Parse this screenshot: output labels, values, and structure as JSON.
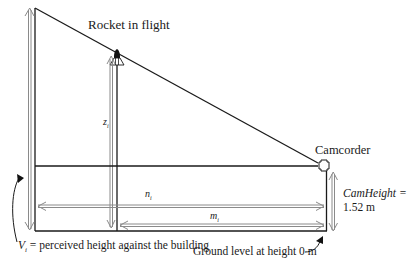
{
  "diagram": {
    "labels": {
      "rocket": "Rocket in flight",
      "camcorder": "Camcorder",
      "z_var": "z",
      "z_sub": "i",
      "n_var": "n",
      "n_sub": "i",
      "m_var": "m",
      "m_sub": "i",
      "cam_height_name": "CamHeight =",
      "cam_height_value": "1.52 m",
      "v_var": "V",
      "v_sub": "i",
      "v_desc": " = perceived height against the building",
      "ground": "Ground level at height 0 m"
    },
    "colors": {
      "line": "#1a1a1a",
      "arrow": "#8a8a8a"
    }
  }
}
